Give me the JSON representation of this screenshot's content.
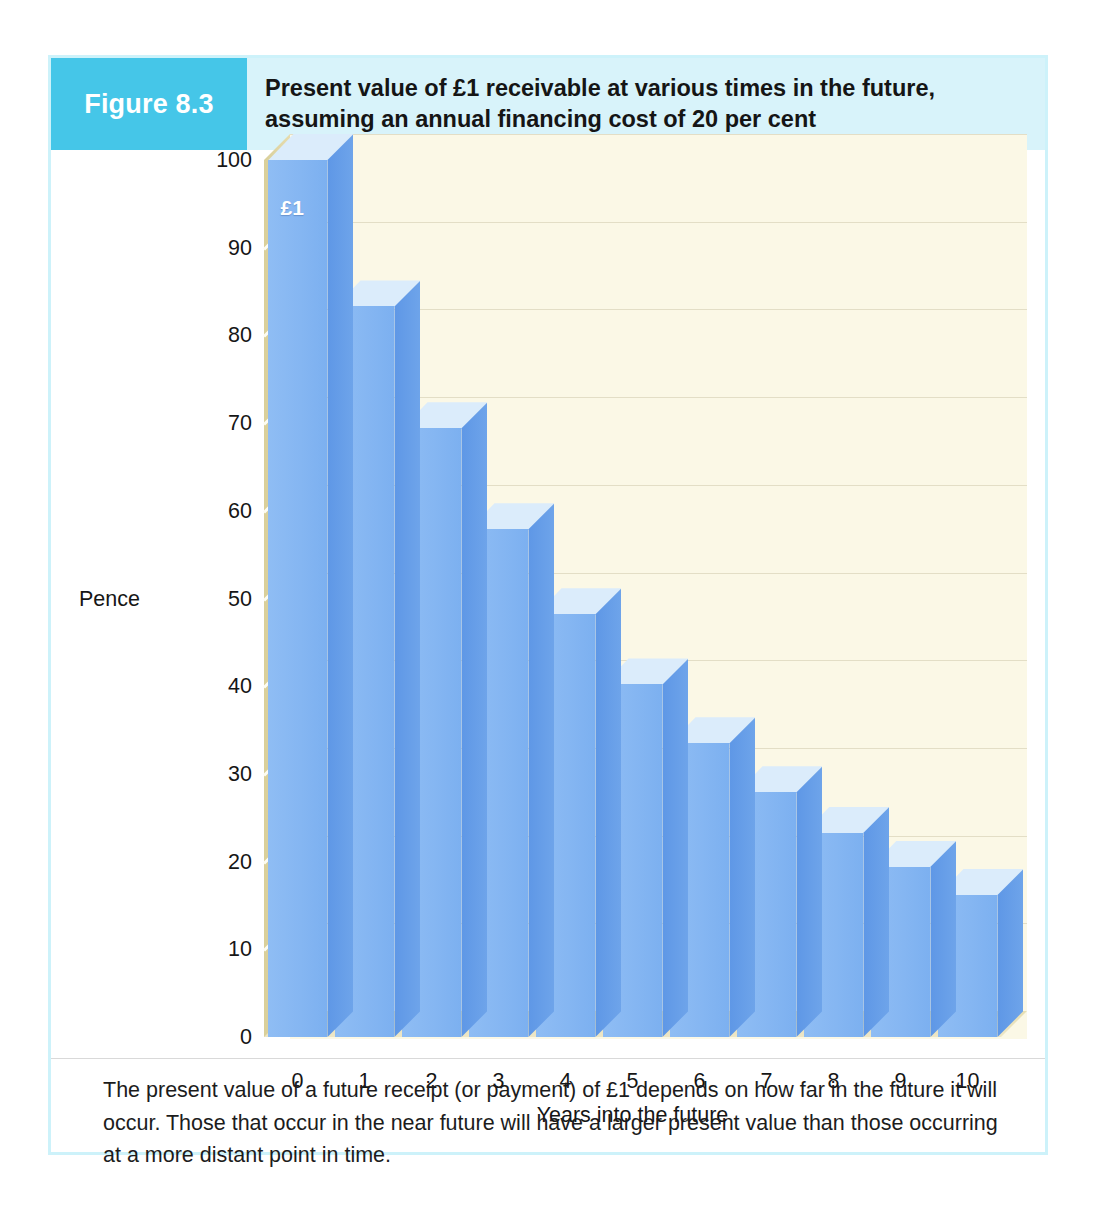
{
  "figure": {
    "tag": "Figure 8.3",
    "title": "Present value of £1 receivable at various times in the future, assuming an annual financing cost of 20 per cent",
    "caption": "The present value of a future receipt (or payment) of £1 depends on how far in the future it will occur. Those that occur in the near future will have a larger present value than those occurring at a more distant point in time."
  },
  "colors": {
    "tag_background": "#45c6e8",
    "header_background": "#d8f3fa",
    "frame_border": "#cdf2fa",
    "plot_background": "#fbf8e6",
    "wall": "#ded4a2",
    "bar_front": "#85b6f2",
    "bar_side": "#6ea4ea",
    "bar_top": "#dbecfb",
    "gridline": "#ded9c0",
    "text": "#1b1b1b"
  },
  "chart_data": {
    "type": "bar",
    "title": "Present value of £1 receivable at various times in the future, assuming an annual financing cost of 20 per cent",
    "xlabel": "Years into the future",
    "ylabel": "Pence",
    "categories": [
      "0",
      "1",
      "2",
      "3",
      "4",
      "5",
      "6",
      "7",
      "8",
      "9",
      "10"
    ],
    "values": [
      100,
      83.3,
      69.4,
      57.9,
      48.2,
      40.2,
      33.5,
      27.9,
      23.3,
      19.4,
      16.2
    ],
    "ylim": [
      0,
      100
    ],
    "yticks": [
      0,
      10,
      20,
      30,
      40,
      50,
      60,
      70,
      80,
      90,
      100
    ],
    "ytick_labels": [
      "0",
      "10",
      "20",
      "30",
      "40",
      "50",
      "60",
      "70",
      "80",
      "90",
      "100"
    ],
    "xtick_labels": [
      "0",
      "1",
      "2",
      "3",
      "4",
      "5",
      "6",
      "7",
      "8",
      "9",
      "10"
    ],
    "grid": true,
    "legend": false,
    "annotations": [
      {
        "series_index": 0,
        "text": "£1",
        "position": "inside-top-left"
      }
    ],
    "discount_rate_percent": 20,
    "style": "3d-column"
  }
}
